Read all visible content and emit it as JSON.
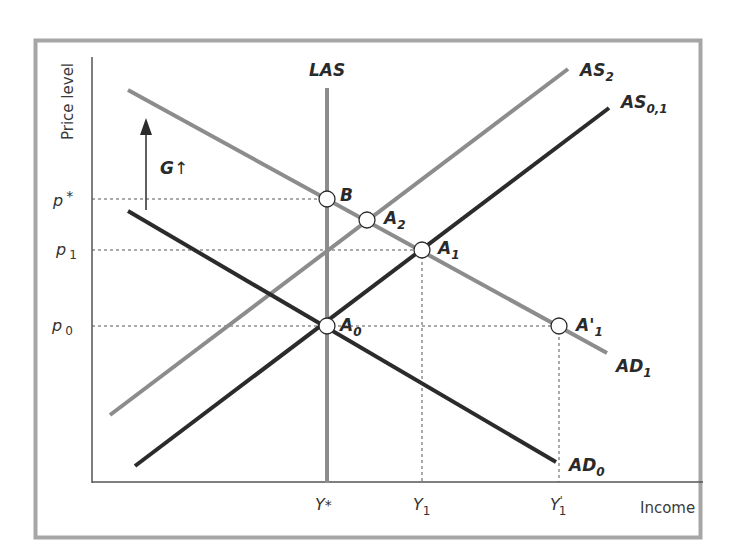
{
  "diagram": {
    "type": "AD-AS model: fiscal expansion (G increase) with long-run aggregate supply",
    "axes": {
      "y_label": "Price level",
      "x_label": "Income"
    },
    "y_ticks": [
      {
        "id": "p_star",
        "base": "p",
        "sup": "*",
        "sub": ""
      },
      {
        "id": "p1",
        "base": "p",
        "sup": "",
        "sub": "1"
      },
      {
        "id": "p0",
        "base": "p",
        "sup": "",
        "sub": "0"
      }
    ],
    "x_ticks": [
      {
        "id": "y_star",
        "base": "Y",
        "sup": "*",
        "sub": ""
      },
      {
        "id": "y1",
        "base": "Y",
        "sup": "",
        "sub": "1"
      },
      {
        "id": "y1_prime",
        "base": "Y",
        "sup": "'",
        "sub": "1"
      }
    ],
    "curves": {
      "las": {
        "base": "LAS",
        "sub": "",
        "color": "#8c8c8c"
      },
      "as2": {
        "base": "AS",
        "sub": "2",
        "color": "#8c8c8c"
      },
      "as01": {
        "base": "AS",
        "sub": "0,1",
        "color": "#2b2b2b"
      },
      "ad1": {
        "base": "AD",
        "sub": "1",
        "color": "#8c8c8c"
      },
      "ad0": {
        "base": "AD",
        "sub": "0",
        "color": "#2b2b2b"
      }
    },
    "points": {
      "B": {
        "base": "B",
        "sub": ""
      },
      "A2": {
        "base": "A",
        "sub": "2"
      },
      "A1": {
        "base": "A",
        "sub": "1"
      },
      "A0": {
        "base": "A",
        "sub": "0"
      },
      "A1_prime": {
        "base": "A'",
        "sub": "1"
      }
    },
    "shift_arrow": {
      "label": "G",
      "symbol": "↑"
    },
    "colors": {
      "frame": "#a6a6a6",
      "axis": "#555555",
      "dark_curve": "#2b2b2b",
      "light_curve": "#8c8c8c",
      "guide": "#555555"
    }
  }
}
